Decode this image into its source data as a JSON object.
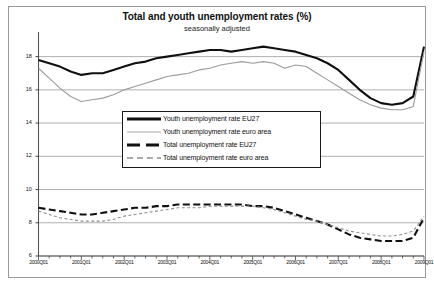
{
  "chart_data": {
    "type": "line",
    "title": "Total and youth unemployment rates (%)",
    "subtitle": "seasonally adjusted",
    "xlabel": "",
    "ylabel": "",
    "ylim": [
      6,
      19
    ],
    "yticks": [
      6,
      8,
      10,
      12,
      14,
      16,
      18
    ],
    "grid": true,
    "legend_position": "center",
    "x_tick_labels": [
      "2000Q01",
      "2001Q01",
      "2002Q01",
      "2003Q01",
      "2004Q01",
      "2005Q01",
      "2006Q01",
      "2007Q01",
      "2008Q01",
      "2009Q01"
    ],
    "x_minor_ticks_per_label": 4,
    "x": [
      "2000Q1",
      "2000Q2",
      "2000Q3",
      "2000Q4",
      "2001Q1",
      "2001Q2",
      "2001Q3",
      "2001Q4",
      "2002Q1",
      "2002Q2",
      "2002Q3",
      "2002Q4",
      "2003Q1",
      "2003Q2",
      "2003Q3",
      "2003Q4",
      "2004Q1",
      "2004Q2",
      "2004Q3",
      "2004Q4",
      "2005Q1",
      "2005Q2",
      "2005Q3",
      "2005Q4",
      "2006Q1",
      "2006Q2",
      "2006Q3",
      "2006Q4",
      "2007Q1",
      "2007Q2",
      "2007Q3",
      "2007Q4",
      "2008Q1",
      "2008Q2",
      "2008Q3",
      "2008Q4",
      "2009Q1"
    ],
    "series": [
      {
        "name": "Youth unemployment rate EU27",
        "style": "solid-thick",
        "color": "#101010",
        "width": 2.1,
        "values": [
          17.8,
          17.6,
          17.4,
          17.1,
          16.9,
          17.0,
          17.0,
          17.2,
          17.4,
          17.6,
          17.7,
          17.9,
          18.0,
          18.1,
          18.2,
          18.3,
          18.4,
          18.4,
          18.3,
          18.4,
          18.5,
          18.6,
          18.5,
          18.4,
          18.3,
          18.1,
          17.9,
          17.6,
          17.2,
          16.6,
          16.0,
          15.5,
          15.2,
          15.1,
          15.2,
          15.6,
          18.6
        ]
      },
      {
        "name": "Youth unemployment rate euro area",
        "style": "solid-thin",
        "color": "#9b9b9b",
        "width": 1.1,
        "values": [
          17.3,
          16.7,
          16.1,
          15.6,
          15.3,
          15.4,
          15.5,
          15.7,
          16.0,
          16.2,
          16.4,
          16.6,
          16.8,
          16.9,
          17.0,
          17.2,
          17.3,
          17.5,
          17.6,
          17.7,
          17.6,
          17.7,
          17.6,
          17.3,
          17.5,
          17.4,
          17.0,
          16.6,
          16.2,
          15.8,
          15.4,
          15.1,
          14.9,
          14.8,
          14.8,
          15.0,
          18.3
        ]
      },
      {
        "name": "Total unemployment rate EU27",
        "style": "dashed-thick",
        "color": "#101010",
        "width": 2.1,
        "values": [
          8.9,
          8.8,
          8.7,
          8.6,
          8.5,
          8.5,
          8.6,
          8.7,
          8.8,
          8.9,
          8.9,
          9.0,
          9.0,
          9.1,
          9.1,
          9.1,
          9.1,
          9.1,
          9.1,
          9.1,
          9.0,
          9.0,
          8.9,
          8.7,
          8.5,
          8.3,
          8.1,
          7.9,
          7.6,
          7.3,
          7.1,
          7.0,
          6.9,
          6.9,
          6.9,
          7.1,
          8.3
        ]
      },
      {
        "name": "Total unemployment rate euro area",
        "style": "dashed-thin",
        "color": "#8f8f8f",
        "width": 1.1,
        "values": [
          8.7,
          8.5,
          8.3,
          8.2,
          8.1,
          8.1,
          8.1,
          8.2,
          8.4,
          8.5,
          8.6,
          8.7,
          8.8,
          8.9,
          8.9,
          8.9,
          9.0,
          9.0,
          9.0,
          9.0,
          9.0,
          8.9,
          8.8,
          8.6,
          8.4,
          8.2,
          8.1,
          7.9,
          7.7,
          7.5,
          7.4,
          7.3,
          7.2,
          7.2,
          7.3,
          7.5,
          8.4
        ]
      }
    ]
  },
  "legend": {
    "items": [
      {
        "label": "Youth unemployment rate EU27"
      },
      {
        "label": "Youth unemployment rate euro area"
      },
      {
        "label": "Total unemployment rate EU27"
      },
      {
        "label": "Total unemployment rate euro area"
      }
    ]
  }
}
